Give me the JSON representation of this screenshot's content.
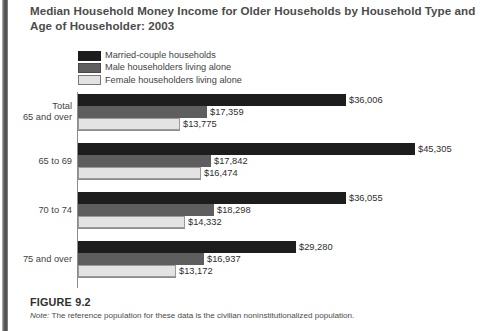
{
  "figure": {
    "title": "Median Household Money Income for Older Households by Household Type and Age of Householder: 2003",
    "number": "FIGURE 9.2",
    "note_lead": "Note:",
    "note_text": " The reference population for these data is the civilian noninstitutionalized population."
  },
  "colors": {
    "married": "#1d1d1d",
    "male": "#5e5e5e",
    "female": "#e3e3e3",
    "axis": "#8c8c8c",
    "text": "#3f3f3f"
  },
  "chart_data": {
    "type": "bar",
    "orientation": "horizontal",
    "title": "Median Household Money Income for Older Households by Household Type and Age of Householder: 2003",
    "xlabel": "",
    "ylabel": "",
    "grid": false,
    "legend_position": "top-left",
    "xlim": [
      0,
      45305
    ],
    "categories": [
      "Total\n65 and over",
      "65 to 69",
      "70 to 74",
      "75 and over"
    ],
    "category_labels": [
      [
        "Total",
        "65 and over"
      ],
      [
        "65 to 69"
      ],
      [
        "70 to 74"
      ],
      [
        "75 and over"
      ]
    ],
    "series": [
      {
        "name": "Married-couple households",
        "key": "married",
        "values": [
          36006,
          45305,
          36055,
          29280
        ],
        "value_labels": [
          "$36,006",
          "$45,305",
          "$36,055",
          "$29,280"
        ]
      },
      {
        "name": "Male householders living alone",
        "key": "male",
        "values": [
          17359,
          17842,
          18298,
          16937
        ],
        "value_labels": [
          "$17,359",
          "$17,842",
          "$18,298",
          "$16,937"
        ]
      },
      {
        "name": "Female householders living alone",
        "key": "female",
        "values": [
          13775,
          16474,
          14332,
          13172
        ],
        "value_labels": [
          "$13,775",
          "$16,474",
          "$14,332",
          "$13,172"
        ]
      }
    ]
  }
}
